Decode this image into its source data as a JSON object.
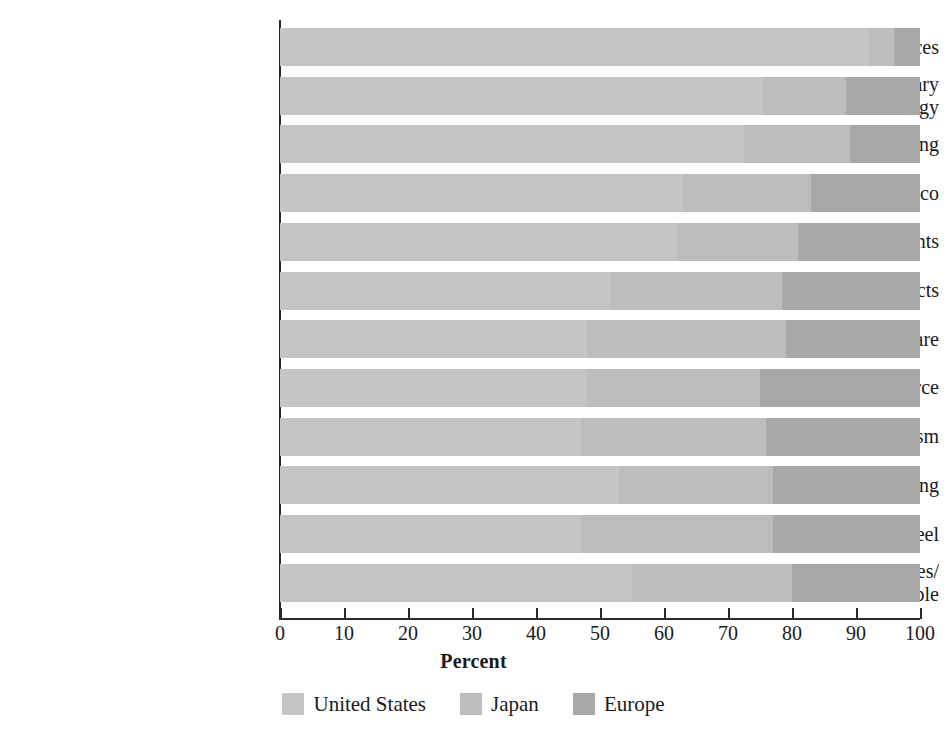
{
  "chart_data": {
    "type": "bar",
    "orientation": "horizontal",
    "stacked": true,
    "normalized_to_percent": true,
    "title": "",
    "xlabel": "Percent",
    "ylabel": "",
    "xlim": [
      0,
      100
    ],
    "grid": false,
    "legend_position": "bottom-center",
    "xticks": [
      "0",
      "10",
      "20",
      "30",
      "40",
      "50",
      "60",
      "70",
      "80",
      "90",
      "100"
    ],
    "xtick_values": [
      0,
      10,
      20,
      30,
      40,
      50,
      60,
      70,
      80,
      90,
      100
    ],
    "categories": [
      "Energy Equipment/Services",
      "Aerospace/Military\nTechnology",
      "Data Processing",
      "Beverage/Tobacco",
      "Electronic Components",
      "Forest and Paper Products",
      "Health/Personal Care",
      "Energy Source",
      "Leisure/Tourism",
      "Machinery/Engineering",
      "Steel",
      "Appliances/\nHousehold Durable"
    ],
    "series": [
      {
        "name": "United States",
        "color": "#c5c5c5",
        "values": [
          92,
          75.5,
          72.5,
          63,
          62,
          51.5,
          48,
          48,
          47,
          53,
          47,
          55
        ]
      },
      {
        "name": "Japan",
        "color": "#bdbdbd",
        "values": [
          4,
          13,
          16.5,
          20,
          19,
          27,
          31,
          27,
          29,
          24,
          30,
          25
        ]
      },
      {
        "name": "Europe",
        "color": "#a8a8a8",
        "values": [
          4,
          11.5,
          11,
          17,
          19,
          21.5,
          21,
          25,
          24,
          23,
          23,
          20
        ]
      }
    ]
  },
  "legend": {
    "items": [
      {
        "label": "United States",
        "color": "#c5c5c5"
      },
      {
        "label": "Japan",
        "color": "#bdbdbd"
      },
      {
        "label": "Europe",
        "color": "#a8a8a8"
      }
    ]
  }
}
